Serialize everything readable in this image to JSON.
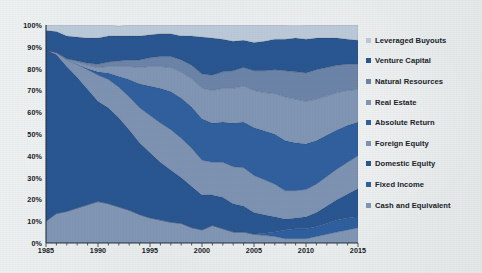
{
  "chart_data": {
    "type": "area",
    "title": "",
    "subtitle": "",
    "xlabel": "",
    "ylabel": "",
    "stacked": true,
    "normalized": "100% stacked",
    "grid": false,
    "legend_position": "right",
    "xlim": [
      1985,
      2015
    ],
    "ylim": [
      0,
      100
    ],
    "x_tick_labels": [
      "1985",
      "1990",
      "1995",
      "2000",
      "2005",
      "2010",
      "2015"
    ],
    "x_tick_values": [
      1985,
      1990,
      1995,
      2000,
      2005,
      2010,
      2015
    ],
    "y_tick_labels": [
      "0%",
      "10%",
      "20%",
      "30%",
      "40%",
      "50%",
      "60%",
      "70%",
      "80%",
      "90%",
      "100%"
    ],
    "y_tick_values": [
      0,
      10,
      20,
      30,
      40,
      50,
      60,
      70,
      80,
      90,
      100
    ],
    "x": [
      1985,
      1986,
      1987,
      1988,
      1989,
      1990,
      1991,
      1992,
      1993,
      1994,
      1995,
      1996,
      1997,
      1998,
      1999,
      2000,
      2001,
      2002,
      2003,
      2004,
      2005,
      2006,
      2007,
      2008,
      2009,
      2010,
      2011,
      2012,
      2013,
      2014,
      2015
    ],
    "stack_order_top_to_bottom": [
      "Leveraged Buyouts",
      "Venture Capital",
      "Natural Resources",
      "Real Estate",
      "Absolute Return",
      "Foreign Equity",
      "Domestic Equity",
      "Fixed Income",
      "Cash and Equivalent"
    ],
    "series": [
      {
        "name": "Cash and Equivalent",
        "color": "#8196b4",
        "values": [
          10.0,
          13.5,
          14.5,
          16.0,
          17.5,
          19.0,
          18.0,
          16.5,
          15.0,
          13.0,
          11.5,
          10.5,
          9.5,
          9.0,
          7.0,
          6.0,
          8.0,
          6.5,
          5.0,
          5.0,
          4.0,
          3.5,
          3.0,
          2.0,
          2.0,
          2.0,
          3.0,
          4.0,
          5.0,
          6.0,
          7.0
        ]
      },
      {
        "name": "Fixed Income",
        "color": "#2f5f9e",
        "values": [
          0.0,
          0.0,
          0.0,
          0.0,
          0.0,
          0.0,
          0.0,
          0.0,
          0.0,
          0.0,
          0.0,
          0.0,
          0.0,
          0.0,
          0.0,
          0.0,
          0.0,
          0.0,
          0.0,
          0.0,
          0.0,
          1.0,
          2.0,
          4.0,
          4.5,
          4.5,
          4.5,
          5.0,
          5.5,
          5.5,
          5.0
        ]
      },
      {
        "name": "Domestic Equity",
        "color": "#2a5691",
        "values": [
          78.5,
          73.0,
          66.5,
          60.0,
          53.0,
          46.0,
          44.0,
          41.0,
          37.0,
          33.0,
          30.0,
          26.5,
          24.0,
          21.0,
          19.0,
          16.0,
          14.0,
          14.5,
          13.0,
          12.0,
          10.0,
          8.5,
          7.0,
          5.0,
          5.0,
          5.5,
          6.5,
          8.0,
          9.5,
          11.0,
          13.0
        ]
      },
      {
        "name": "Foreign Equity",
        "color": "#7e93b2",
        "values": [
          0.0,
          1.0,
          3.0,
          6.0,
          9.0,
          12.0,
          13.0,
          14.0,
          15.0,
          16.0,
          17.0,
          18.0,
          18.5,
          18.0,
          17.5,
          16.0,
          15.0,
          16.0,
          17.0,
          17.5,
          17.0,
          16.0,
          15.0,
          13.0,
          12.5,
          12.5,
          13.0,
          13.5,
          14.0,
          14.5,
          15.0
        ]
      },
      {
        "name": "Absolute Return",
        "color": "#31609e",
        "values": [
          0.0,
          0.0,
          0.0,
          0.0,
          0.5,
          1.5,
          3.0,
          5.0,
          8.0,
          11.0,
          13.5,
          16.0,
          17.5,
          18.5,
          19.0,
          19.0,
          18.0,
          18.5,
          20.0,
          21.0,
          22.0,
          22.5,
          23.0,
          23.0,
          22.0,
          21.0,
          20.0,
          19.0,
          18.0,
          17.0,
          15.5
        ]
      },
      {
        "name": "Real Estate",
        "color": "#8196b4",
        "values": [
          0.0,
          0.0,
          0.5,
          1.0,
          1.5,
          2.0,
          3.0,
          4.5,
          6.0,
          7.5,
          9.0,
          10.0,
          11.0,
          12.0,
          13.0,
          14.0,
          15.0,
          15.5,
          16.0,
          16.5,
          17.0,
          17.5,
          18.5,
          20.0,
          20.0,
          19.5,
          19.0,
          18.0,
          17.0,
          16.0,
          15.0
        ]
      },
      {
        "name": "Natural Resources",
        "color": "#6c84a8",
        "values": [
          0.0,
          0.0,
          0.0,
          0.5,
          1.0,
          1.5,
          2.0,
          2.5,
          3.0,
          3.5,
          4.0,
          4.5,
          5.0,
          5.5,
          6.0,
          6.5,
          7.0,
          7.5,
          8.0,
          8.5,
          9.0,
          10.0,
          11.0,
          12.0,
          12.5,
          13.0,
          13.5,
          13.0,
          12.5,
          12.0,
          11.5
        ]
      },
      {
        "name": "Venture Capital",
        "color": "#2a5691",
        "values": [
          9.0,
          9.5,
          10.5,
          11.0,
          11.5,
          12.0,
          12.0,
          11.5,
          11.0,
          11.0,
          10.5,
          10.5,
          10.5,
          11.0,
          13.5,
          17.0,
          17.0,
          15.0,
          13.5,
          12.5,
          13.0,
          13.5,
          14.0,
          14.5,
          15.5,
          15.5,
          14.5,
          13.5,
          12.5,
          11.5,
          11.0
        ]
      },
      {
        "name": "Leveraged Buyouts",
        "color": "#bcc9d8",
        "values": [
          2.5,
          3.0,
          5.0,
          5.5,
          6.0,
          6.0,
          5.0,
          4.5,
          5.0,
          5.0,
          4.5,
          4.0,
          4.0,
          5.0,
          5.0,
          5.5,
          6.0,
          6.5,
          7.5,
          7.0,
          8.0,
          7.5,
          6.5,
          6.5,
          6.5,
          6.5,
          6.0,
          6.0,
          6.0,
          6.5,
          7.0
        ]
      }
    ]
  },
  "legend": {
    "items": [
      {
        "label": "Leveraged Buyouts",
        "color": "#bcc9d8"
      },
      {
        "label": "Venture Capital",
        "color": "#2a5691"
      },
      {
        "label": "Natural Resources",
        "color": "#6c84a8"
      },
      {
        "label": "Real Estate",
        "color": "#8196b4"
      },
      {
        "label": "Absolute Return",
        "color": "#31609e"
      },
      {
        "label": "Foreign Equity",
        "color": "#7e93b2"
      },
      {
        "label": "Domestic Equity",
        "color": "#2a5691"
      },
      {
        "label": "Fixed Income",
        "color": "#2f5f9e"
      },
      {
        "label": "Cash and Equivalent",
        "color": "#8196b4"
      }
    ]
  },
  "caption": {
    "text": ""
  }
}
